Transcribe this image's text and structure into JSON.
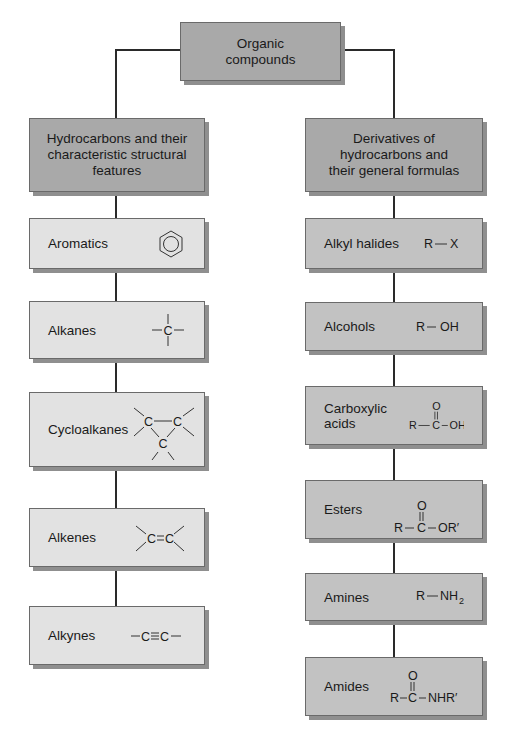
{
  "root": {
    "title": "Organic\ncompounds"
  },
  "left_branch": {
    "title": "Hydrocarbons and their\ncharacteristic structural\nfeatures",
    "items": [
      {
        "label": "Aromatics",
        "formula": "benzene-ring-icon"
      },
      {
        "label": "Alkanes",
        "formula": "—C— (tetrahedral carbon)"
      },
      {
        "label": "Cycloalkanes",
        "formula": "cyclopropane ring (C—C, C)"
      },
      {
        "label": "Alkenes",
        "formula": "C=C"
      },
      {
        "label": "Alkynes",
        "formula": "—C≡C—"
      }
    ]
  },
  "right_branch": {
    "title": "Derivatives of\nhydrocarbons and\ntheir general formulas",
    "items": [
      {
        "label": "Alkyl halides",
        "formula": "R—X"
      },
      {
        "label": "Alcohols",
        "formula": "R— OH"
      },
      {
        "label": "Carboxylic acids",
        "formula": "R—C(=O)—OH"
      },
      {
        "label": "Esters",
        "formula": "R—C(=O)—OR′"
      },
      {
        "label": "Amines",
        "formula": "R—NH₂"
      },
      {
        "label": "Amides",
        "formula": "R—C(=O)—NHR′"
      }
    ]
  },
  "formula_text": {
    "C": "C",
    "R": "R",
    "X": "X",
    "OH": "OH",
    "O": "O",
    "ORp": "OR′",
    "NH": "NH",
    "sub2": "2",
    "NHRp": "NHR′"
  },
  "colors": {
    "root": "#a9a9a9",
    "right_boxes": "#c2c2c2",
    "left_boxes": "#e2e2e2",
    "line": "#2a2a2a"
  }
}
